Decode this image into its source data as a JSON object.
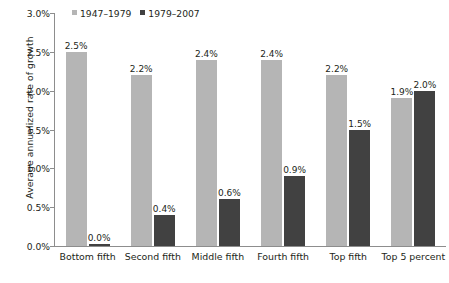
{
  "chart_data": {
    "type": "bar",
    "title": "",
    "subtitle": "",
    "xlabel": "",
    "ylabel": "Average annualized rate of growth",
    "ylim": [
      0,
      3.0
    ],
    "ytick_labels": [
      "0.0%",
      "0.5%",
      "1.0%",
      "1.5%",
      "2.0%",
      "2.5%",
      "3.0%"
    ],
    "ytick_values": [
      0.0,
      0.5,
      1.0,
      1.5,
      2.0,
      2.5,
      3.0
    ],
    "grid": false,
    "legend_position": "top-left",
    "categories": [
      "Bottom fifth",
      "Second fifth",
      "Middle fifth",
      "Fourth fifth",
      "Top fifth",
      "Top 5 percent"
    ],
    "series": [
      {
        "name": "1947–1979",
        "color": "#b5b5b5",
        "values": [
          2.5,
          2.2,
          2.4,
          2.4,
          2.2,
          1.9
        ],
        "value_labels": [
          "2.5%",
          "2.2%",
          "2.4%",
          "2.4%",
          "2.2%",
          "1.9%"
        ]
      },
      {
        "name": "1979–2007",
        "color": "#414141",
        "values": [
          0.0,
          0.4,
          0.6,
          0.9,
          1.5,
          2.0
        ],
        "value_labels": [
          "0.0%",
          "0.4%",
          "0.6%",
          "0.9%",
          "1.5%",
          "2.0%"
        ]
      }
    ]
  },
  "legend": {
    "items": [
      {
        "label": "1947–1979",
        "color": "#b5b5b5"
      },
      {
        "label": "1979–2007",
        "color": "#414141"
      }
    ]
  },
  "colors": {
    "series_a": "#b5b5b5",
    "series_b": "#414141",
    "axis": "#8d8d8d",
    "text": "#231f20",
    "background": "#ffffff"
  }
}
